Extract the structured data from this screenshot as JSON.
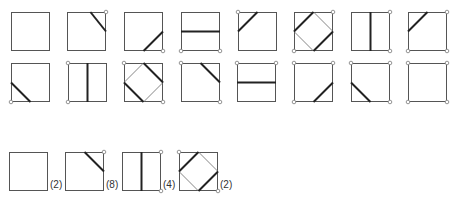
{
  "colors": {
    "frame": "#555555",
    "thick": "#222222",
    "thin": "#777777",
    "dot": "#888888"
  },
  "rows": [
    {
      "y": 12,
      "tiles": [
        {
          "x": 11,
          "lines": [],
          "dots": []
        },
        {
          "x": 67,
          "lines": [
            [
              "T60",
              "R50"
            ]
          ],
          "dots": [
            "TR"
          ]
        },
        {
          "x": 124,
          "lines": [
            [
              "B50",
              "R50"
            ]
          ],
          "dots": [
            "BR"
          ]
        },
        {
          "x": 181,
          "lines": [
            [
              "L50",
              "R50"
            ]
          ],
          "dots": [
            "BL",
            "BR"
          ]
        },
        {
          "x": 238,
          "lines": [
            [
              "L50",
              "T50"
            ]
          ],
          "dots": [
            "TL"
          ]
        },
        {
          "x": 294,
          "lines": [
            [
              "L50",
              "T50"
            ],
            [
              "B50",
              "R50"
            ]
          ],
          "thin": [
            [
              "T50",
              "R50"
            ],
            [
              "L50",
              "B50"
            ]
          ],
          "dots": [
            "TR",
            "BL"
          ]
        },
        {
          "x": 351,
          "lines": [
            [
              "T50",
              "B50"
            ]
          ],
          "dots": [
            "TR",
            "BR"
          ]
        },
        {
          "x": 408,
          "lines": [
            [
              "L50",
              "T50"
            ]
          ],
          "dots": [
            "TR",
            "BL",
            "BR"
          ]
        }
      ]
    },
    {
      "y": 63,
      "tiles": [
        {
          "x": 11,
          "lines": [
            [
              "L50",
              "B50"
            ]
          ],
          "dots": [
            "BL"
          ]
        },
        {
          "x": 68,
          "lines": [
            [
              "T50",
              "B50"
            ]
          ],
          "dots": [
            "TL",
            "BL"
          ]
        },
        {
          "x": 124,
          "lines": [
            [
              "L50",
              "B50"
            ],
            [
              "T50",
              "R50"
            ]
          ],
          "thin": [
            [
              "L50",
              "T50"
            ],
            [
              "B50",
              "R50"
            ]
          ],
          "dots": [
            "TL",
            "BR"
          ]
        },
        {
          "x": 181,
          "lines": [
            [
              "T50",
              "R50"
            ]
          ],
          "dots": [
            "TL",
            "BR"
          ]
        },
        {
          "x": 237,
          "lines": [
            [
              "L50",
              "R50"
            ]
          ],
          "dots": [
            "TL",
            "TR"
          ]
        },
        {
          "x": 294,
          "lines": [
            [
              "B50",
              "R50"
            ]
          ],
          "dots": [
            "TL",
            "TR",
            "BL"
          ]
        },
        {
          "x": 351,
          "lines": [
            [
              "L50",
              "B50"
            ]
          ],
          "dots": [
            "TL",
            "TR",
            "BR"
          ]
        },
        {
          "x": 408,
          "lines": [],
          "dots": [
            "TL",
            "TR",
            "BL",
            "BR"
          ]
        }
      ]
    },
    {
      "y": 152,
      "tiles": [
        {
          "x": 9,
          "lines": [],
          "dots": [],
          "count": "(2)"
        },
        {
          "x": 65,
          "lines": [
            [
              "T50",
              "R50"
            ]
          ],
          "dots": [
            "TR"
          ],
          "count": "(8)"
        },
        {
          "x": 122,
          "lines": [
            [
              "T50",
              "B50"
            ]
          ],
          "dots": [
            "TR",
            "BR"
          ],
          "count": "(4)"
        },
        {
          "x": 179,
          "lines": [
            [
              "L50",
              "T50"
            ],
            [
              "B50",
              "R50"
            ]
          ],
          "thin": [
            [
              "T50",
              "R50"
            ],
            [
              "L50",
              "B50"
            ]
          ],
          "dots": [
            "TL",
            "BR"
          ],
          "count": "(2)"
        }
      ]
    }
  ]
}
